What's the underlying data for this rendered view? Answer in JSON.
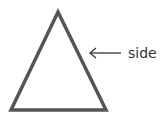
{
  "diagram": {
    "shape": "triangle",
    "stroke_color": "#555555",
    "label": "side",
    "arrow_direction": "left"
  }
}
